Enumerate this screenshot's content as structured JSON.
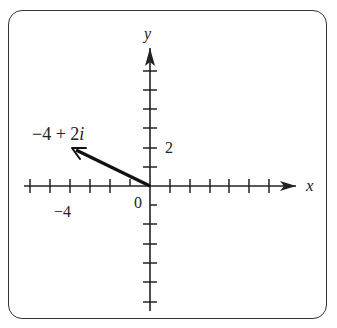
{
  "diagram": {
    "type": "complex-plane-vector",
    "axes": {
      "x_label": "x",
      "y_label": "y",
      "origin_label": "0",
      "x_tick_label": "−4",
      "y_tick_label": "2",
      "x_range": [
        -6,
        6
      ],
      "y_range": [
        -6,
        6
      ],
      "tick_step": 1
    },
    "vector": {
      "label": "−4 + 2i",
      "from": [
        0,
        0
      ],
      "to": [
        -4,
        2
      ]
    },
    "colors": {
      "ink": "#222222",
      "frame": "#333333",
      "background": "#ffffff"
    }
  }
}
